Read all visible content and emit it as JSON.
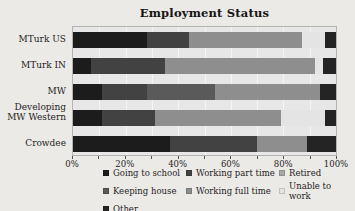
{
  "chart_data": {
    "type": "bar",
    "variant": "horizontal-stacked",
    "title": "Employment Status",
    "categories": [
      "MTurk US",
      "MTurk IN",
      "MW Developing",
      "MW Western",
      "Crowdee"
    ],
    "series": [
      {
        "name": "Going to school",
        "color": "#1c1c1c",
        "values": [
          28,
          7,
          11,
          11,
          37
        ]
      },
      {
        "name": "Working part time",
        "color": "#424242",
        "values": [
          16,
          28,
          17,
          20,
          33
        ]
      },
      {
        "name": "Retired",
        "color": "#a8a8a8",
        "values": [
          0,
          0,
          0,
          0,
          0
        ]
      },
      {
        "name": "Keeping house",
        "color": "#5a5a5a",
        "values": [
          0,
          0,
          26,
          0,
          0
        ]
      },
      {
        "name": "Working full time",
        "color": "#8e8e8e",
        "values": [
          43,
          57,
          40,
          48,
          19
        ]
      },
      {
        "name": "Unable to work",
        "color": "#e4e4e4",
        "values": [
          9,
          3,
          0,
          17,
          0
        ]
      },
      {
        "name": "Other",
        "color": "#242424",
        "values": [
          4,
          5,
          6,
          4,
          11
        ]
      }
    ],
    "xlim": [
      0,
      100
    ],
    "x_tick_labels": [
      "0%",
      "20%",
      "40%",
      "60%",
      "80%",
      "100%"
    ],
    "x_minor_tick_step": 10,
    "grid": "vertical",
    "legend_position": "bottom",
    "legend_columns": 3,
    "legend_order": [
      "Going to school",
      "Working part time",
      "Retired",
      "Keeping house",
      "Working full time",
      "Unable to work",
      "Other"
    ]
  }
}
